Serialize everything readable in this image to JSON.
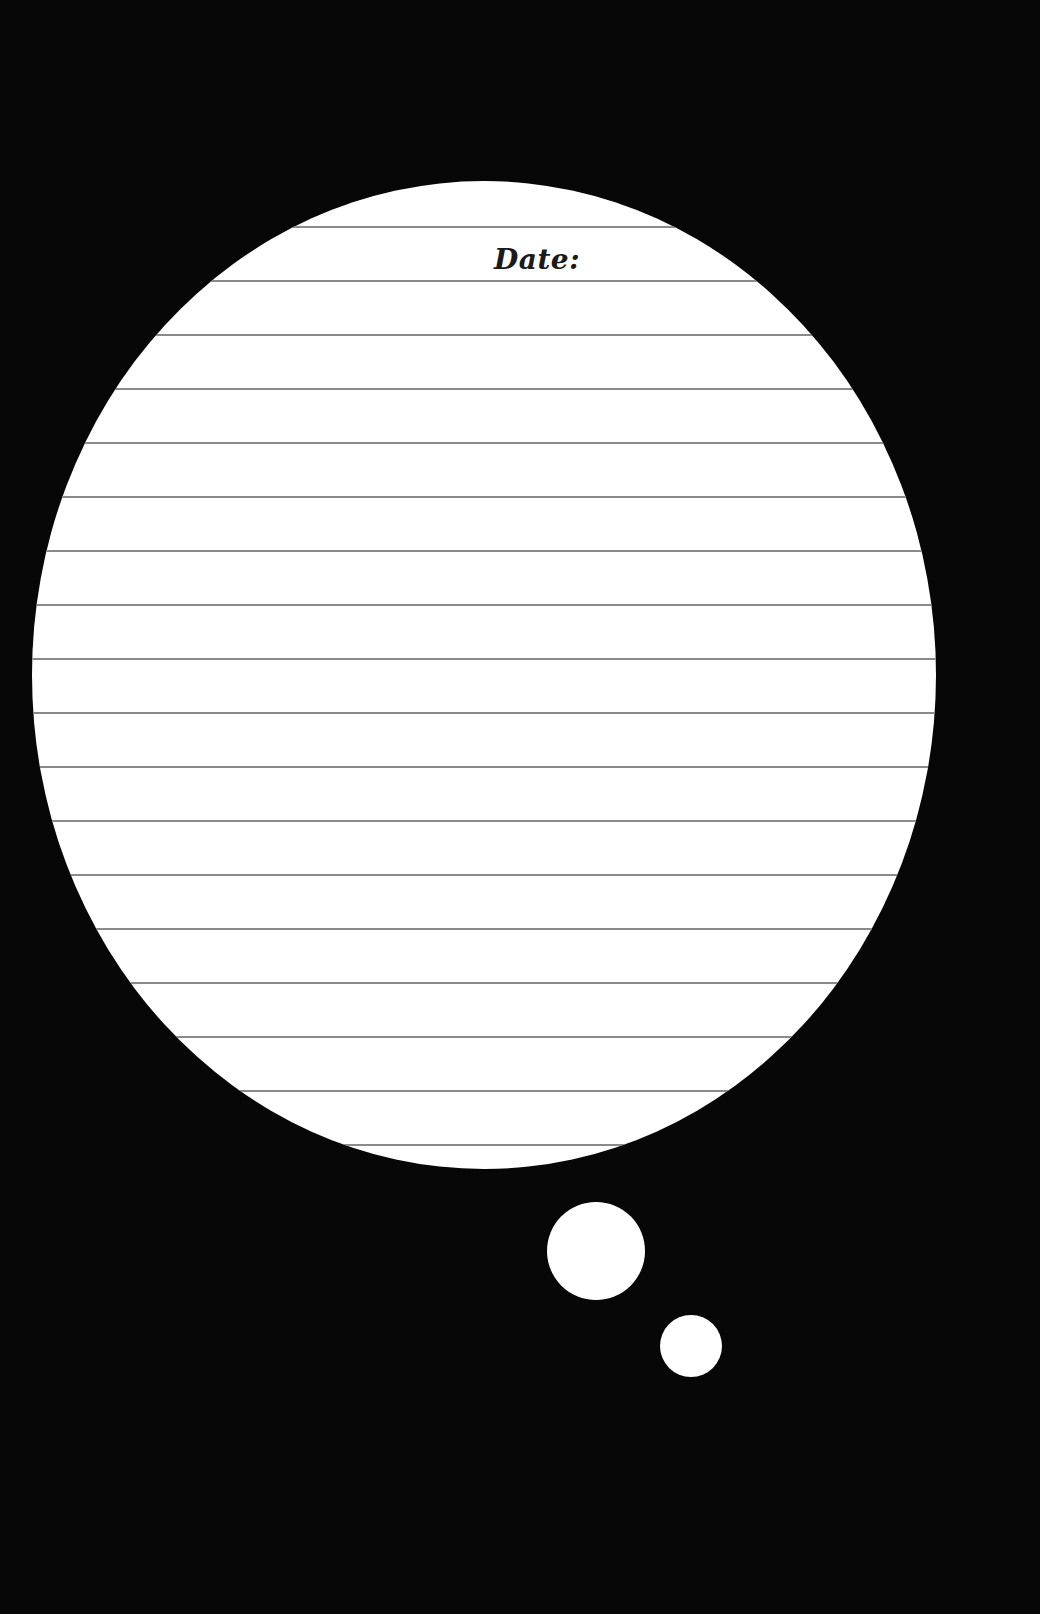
{
  "page": {
    "background_color": "#070707",
    "type": "lined journal page"
  },
  "thought_bubble": {
    "fill_color": "#ffffff",
    "main_ellipse": {
      "cx": 484,
      "cy": 675,
      "rx": 452,
      "ry": 494
    },
    "bubble_large": {
      "cx": 596,
      "cy": 1251,
      "r": 49
    },
    "bubble_small": {
      "cx": 691,
      "cy": 1346,
      "r": 31
    }
  },
  "header": {
    "date_label": "Date:"
  },
  "ruled_lines": {
    "color": "#8a8a8a",
    "first_y": 227,
    "spacing": 54,
    "count": 18,
    "thickness": 2
  }
}
